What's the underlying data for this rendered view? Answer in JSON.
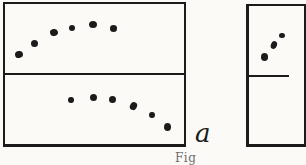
{
  "figure": {
    "panel_label": "a",
    "caption_partial": "Fig",
    "colors": {
      "paper": "#fbfaf7",
      "ink": "#1b1b1b",
      "caption_ink": "#6e6e6e"
    },
    "dots": {
      "left_panel_top_arc": [
        {
          "x": 19,
          "y": 54.5,
          "w": 8,
          "h": 7,
          "r": -10
        },
        {
          "x": 34.5,
          "y": 43,
          "w": 7,
          "h": 7,
          "r": 0
        },
        {
          "x": 53.5,
          "y": 32.5,
          "w": 8,
          "h": 7,
          "r": -15
        },
        {
          "x": 71.5,
          "y": 28,
          "w": 6,
          "h": 6,
          "r": 0
        },
        {
          "x": 93,
          "y": 24.5,
          "w": 8,
          "h": 7,
          "r": 0
        },
        {
          "x": 113,
          "y": 28.5,
          "w": 7,
          "h": 6.5,
          "r": 0
        }
      ],
      "left_panel_bottom_arc": [
        {
          "x": 71,
          "y": 100,
          "w": 6,
          "h": 6.5,
          "r": 0
        },
        {
          "x": 93,
          "y": 97.5,
          "w": 7,
          "h": 7,
          "r": 0
        },
        {
          "x": 112,
          "y": 99.5,
          "w": 7,
          "h": 7,
          "r": 0
        },
        {
          "x": 133,
          "y": 106,
          "w": 6.5,
          "h": 8,
          "r": 25
        },
        {
          "x": 152,
          "y": 115,
          "w": 6,
          "h": 6.5,
          "r": 0
        },
        {
          "x": 167.5,
          "y": 127,
          "w": 7,
          "h": 8,
          "r": 0
        }
      ],
      "right_panel_top_arc": [
        {
          "x": 264.5,
          "y": 57,
          "w": 7,
          "h": 7.5,
          "r": 0
        },
        {
          "x": 273.5,
          "y": 45,
          "w": 6,
          "h": 7.5,
          "r": 20
        },
        {
          "x": 282,
          "y": 35.5,
          "w": 6,
          "h": 5.5,
          "r": 0
        }
      ]
    }
  }
}
